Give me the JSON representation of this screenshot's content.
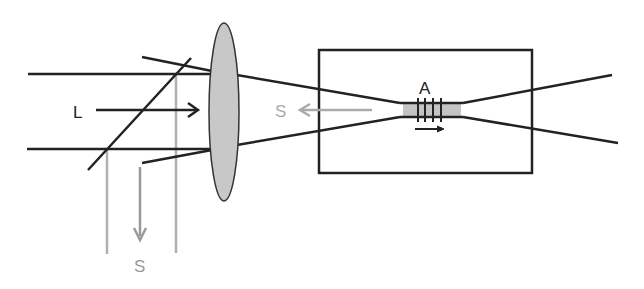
{
  "diagram": {
    "labels": {
      "laser": "L",
      "scattered_back": "S",
      "scattered_out": "S",
      "acoustic": "A"
    },
    "colors": {
      "beam": "#222222",
      "scattered": "#aaaaaa",
      "lens_fill": "#c8c8c8",
      "interaction_fill": "#c4c4c4",
      "background": "#ffffff"
    },
    "components": [
      "laser-beam",
      "beam-splitter",
      "lens",
      "sample-cell",
      "interaction-region",
      "acoustic-grating"
    ]
  }
}
